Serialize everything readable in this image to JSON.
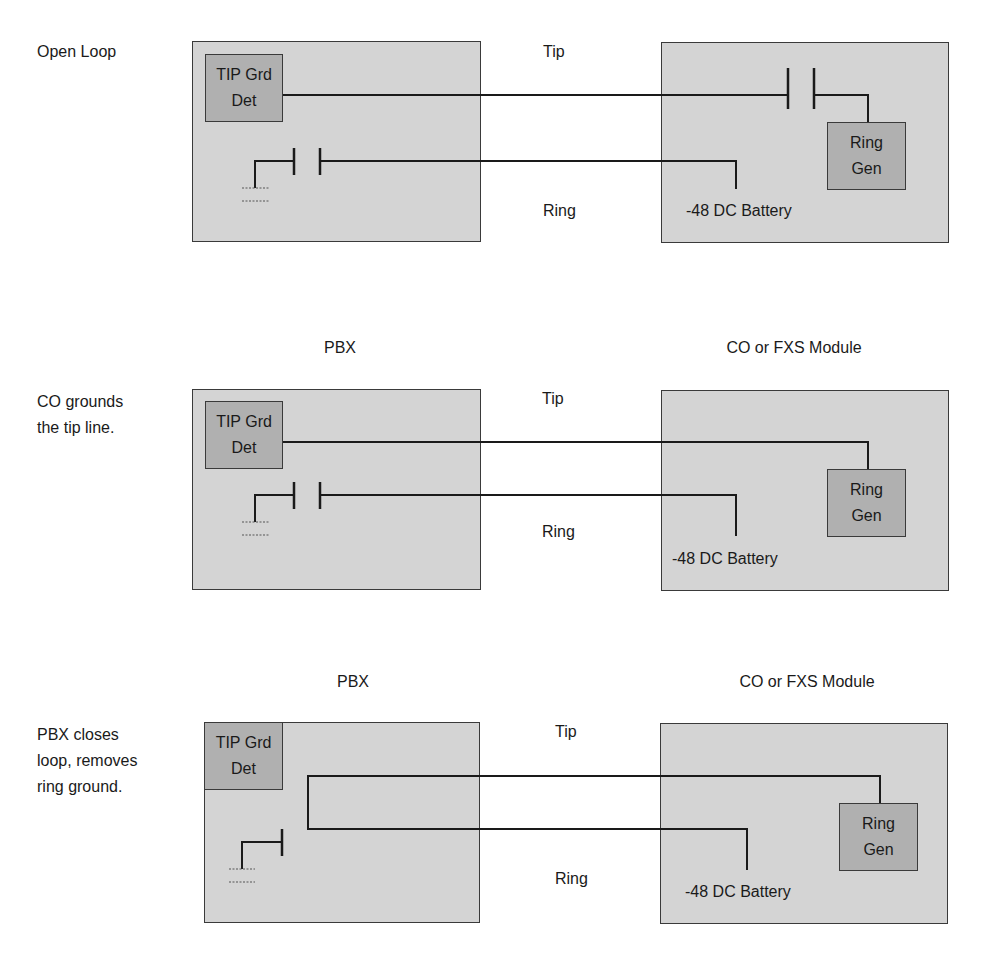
{
  "panels": [
    {
      "caption": "Open Loop",
      "pbx_label": "",
      "co_label": "",
      "tip_label": "Tip",
      "ring_label": "Ring",
      "tip_detector": {
        "line1": "TIP Grd",
        "line2": "Det"
      },
      "ring_generator": {
        "line1": "Ring",
        "line2": "Gen"
      },
      "battery_label": "-48 DC Battery"
    },
    {
      "caption_line1": "CO grounds",
      "caption_line2": "the tip line.",
      "pbx_label": "PBX",
      "co_label": "CO or FXS Module",
      "tip_label": "Tip",
      "ring_label": "Ring",
      "tip_detector": {
        "line1": "TIP Grd",
        "line2": "Det"
      },
      "ring_generator": {
        "line1": "Ring",
        "line2": "Gen"
      },
      "battery_label": "-48 DC Battery"
    },
    {
      "caption_line1": "PBX closes",
      "caption_line2": "loop, removes",
      "caption_line3": "ring ground.",
      "pbx_label": "PBX",
      "co_label": "CO or FXS Module",
      "tip_label": "Tip",
      "ring_label": "Ring",
      "tip_detector": {
        "line1": "TIP Grd",
        "line2": "Det"
      },
      "ring_generator": {
        "line1": "Ring",
        "line2": "Gen"
      },
      "battery_label": "-48 DC Battery"
    }
  ],
  "colors": {
    "box_fill": "#d4d4d4",
    "inner_box_fill": "#b0b0b0",
    "line": "#1a1a1a"
  }
}
